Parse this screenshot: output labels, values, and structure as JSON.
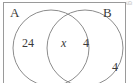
{
  "figure": {
    "type": "venn-diagram",
    "sets": [
      {
        "id": "A",
        "label": "A"
      },
      {
        "id": "B",
        "label": "B"
      }
    ],
    "regions": {
      "left_only": "24",
      "intersection": "x",
      "right_only": "4",
      "outside": "4"
    },
    "margin_artifact": "g",
    "colors": {
      "stroke": "#8c8c8c",
      "frame": "#9a9a9a",
      "text": "#3a3a3a",
      "background": "#ffffff"
    }
  }
}
